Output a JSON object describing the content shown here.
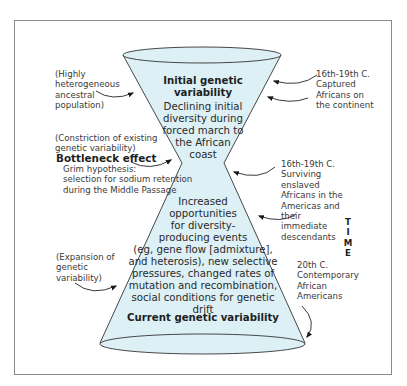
{
  "diagram": {
    "type": "hourglass",
    "fill_color": "#dcf0f5",
    "stroke_color": "#333333",
    "top_section": {
      "title": "Initial genetic\nvariability",
      "text": "Declining initial\ndiversity during\nforced march to\nthe African\ncoast"
    },
    "bottom_section": {
      "text": "Increased\nopportunities\nfor diversity-\nproducing events\n(eg, gene flow [admixture],\nand heterosis), new selective\npressures, changed rates of\nmutation and recombination,\nsocial conditions for genetic drift",
      "title": "Current genetic variability"
    },
    "left_labels": {
      "ancestral": "(Highly\nheterogeneous\nancestral\npopulation)",
      "constriction": "(Constriction of existing\ngenetic variability)",
      "bottleneck_title": "Bottleneck effect",
      "grim": "Grim hypothesis:\nselection for sodium retention\nduring the Middle Passage",
      "expansion": "(Expansion of\ngenetic\nvariability)"
    },
    "right_labels": {
      "captured": "16th-19th C.\nCaptured\nAfricans on\nthe continent",
      "surviving": "16th-19th C.\nSurviving enslaved\nAfricans in the\nAmericas and their\nimmediate\ndescendants",
      "contemporary": "20th C.\nContemporary\nAfrican\nAmericans"
    },
    "time_axis_label": "T\nI\nM\nE"
  }
}
